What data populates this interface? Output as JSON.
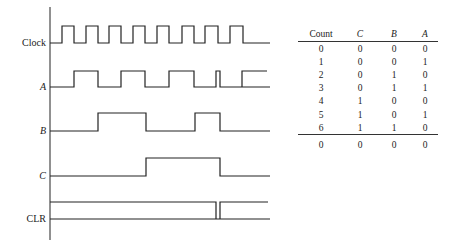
{
  "diagram": {
    "signals": [
      {
        "name": "Clock",
        "italic": false,
        "baseline": 43,
        "high": 26,
        "edges": [
          [
            62,
            74
          ],
          [
            86,
            98
          ],
          [
            109,
            121
          ],
          [
            133,
            145
          ],
          [
            157,
            169
          ],
          [
            182,
            194
          ],
          [
            205,
            218
          ],
          [
            230,
            243
          ]
        ],
        "end": 270
      },
      {
        "name": "A",
        "italic": true,
        "baseline": 87,
        "high": 71,
        "edges": [
          [
            74,
            98
          ],
          [
            121,
            145
          ],
          [
            169,
            194
          ],
          [
            216,
            220
          ],
          [
            242,
            267
          ]
        ],
        "end": 270,
        "last_high_end": true
      },
      {
        "name": "B",
        "italic": true,
        "baseline": 131,
        "high": 113,
        "edges": [
          [
            98,
            146
          ],
          [
            195,
            220
          ]
        ],
        "end": 270
      },
      {
        "name": "C",
        "italic": true,
        "baseline": 176,
        "high": 158,
        "edges": [
          [
            146,
            220
          ]
        ],
        "end": 270
      },
      {
        "name": "CLR",
        "italic": false,
        "baseline": 219,
        "high": 202,
        "inverted": true,
        "edges": [
          [
            216,
            220
          ]
        ],
        "end": 270
      }
    ],
    "axis": {
      "x": 50,
      "top": 7,
      "bottom": 240
    }
  },
  "table": {
    "headers": [
      "Count",
      "C",
      "B",
      "A"
    ],
    "rows": [
      [
        "0",
        "0",
        "0",
        "0"
      ],
      [
        "1",
        "0",
        "0",
        "1"
      ],
      [
        "2",
        "0",
        "1",
        "0"
      ],
      [
        "3",
        "0",
        "1",
        "1"
      ],
      [
        "4",
        "1",
        "0",
        "0"
      ],
      [
        "5",
        "1",
        "0",
        "1"
      ],
      [
        "6",
        "1",
        "1",
        "0"
      ]
    ],
    "footer": [
      "0",
      "0",
      "0",
      "0"
    ]
  }
}
